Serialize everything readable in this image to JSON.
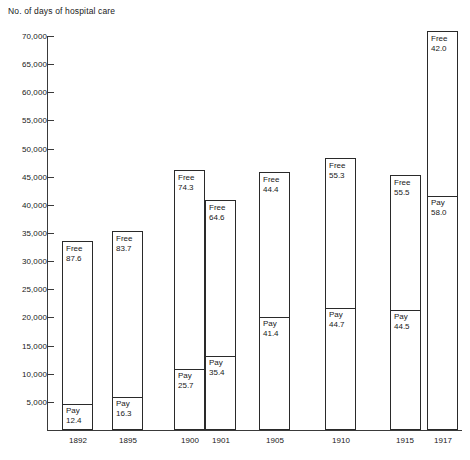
{
  "chart_data": {
    "type": "bar",
    "title": "No. of days of hospital care",
    "xlabel": "",
    "ylabel": "No. of days of hospital care",
    "ylim": [
      0,
      70000
    ],
    "grid": false,
    "legend": "none",
    "stacked": true,
    "note": "Stacked bars: bottom segment = Pay, top segment = Free. Segment labels show percentage share of the bar total.",
    "categories": [
      "1892",
      "1895",
      "1900",
      "1901",
      "1905",
      "1910",
      "1915",
      "1917"
    ],
    "y_ticks": [
      5000,
      10000,
      15000,
      20000,
      25000,
      30000,
      35000,
      40000,
      45000,
      50000,
      55000,
      60000,
      65000,
      70000
    ],
    "y_tick_labels": [
      "5,000",
      "10,000",
      "15,000",
      "20,000",
      "25,000",
      "30,000",
      "35,000",
      "40,000",
      "45,000",
      "50,000",
      "55,000",
      "60,000",
      "65,000",
      "70,000"
    ],
    "series": [
      {
        "name": "Pay",
        "values": [
          4200,
          5800,
          10900,
          13200,
          19500,
          20900,
          20600,
          41000
        ],
        "percent_labels": [
          "12.4",
          "16.3",
          "25.7",
          "35.4",
          "41.4",
          "44.7",
          "44.5",
          "58.0"
        ]
      },
      {
        "name": "Free",
        "values": [
          29700,
          29900,
          31600,
          24100,
          27600,
          25800,
          25700,
          29700
        ],
        "percent_labels": [
          "87.6",
          "83.7",
          "74.3",
          "64.6",
          "58.6",
          "55.3",
          "55.5",
          "42.0"
        ]
      }
    ],
    "bar_totals": [
      33900,
      35700,
      42500,
      37300,
      47100,
      46700,
      46300,
      70700
    ]
  },
  "bars": [
    {
      "year": "1892",
      "x": 62,
      "width": 31,
      "top": 241,
      "bottom": 430,
      "divider": 404,
      "pay": {
        "name": "Pay",
        "value": "12.4"
      },
      "free": {
        "name": "Free",
        "value": "87.6"
      }
    },
    {
      "year": "1895",
      "x": 112,
      "width": 31,
      "top": 231,
      "bottom": 430,
      "divider": 397,
      "pay": {
        "name": "Pay",
        "value": "16.3"
      },
      "free": {
        "name": "Free",
        "value": "83.7"
      }
    },
    {
      "year": "1900",
      "x": 174,
      "width": 31,
      "top": 170,
      "bottom": 430,
      "divider": 369,
      "pay": {
        "name": "Pay",
        "value": "25.7"
      },
      "free": {
        "name": "Free",
        "value": "74.3"
      }
    },
    {
      "year": "1901",
      "x": 205,
      "width": 31,
      "top": 200,
      "bottom": 430,
      "divider": 356,
      "pay": {
        "name": "Pay",
        "value": "35.4"
      },
      "free": {
        "name": "Free",
        "value": "64.6"
      }
    },
    {
      "year": "1905",
      "x": 259,
      "width": 31,
      "top": 172,
      "bottom": 430,
      "divider": 317,
      "pay": {
        "name": "Pay",
        "value": "41.4"
      },
      "free": {
        "name": "Free",
        "value": "44.4"
      }
    },
    {
      "year": "1910",
      "x": 325,
      "width": 31,
      "top": 158,
      "bottom": 430,
      "divider": 308,
      "pay": {
        "name": "Pay",
        "value": "44.7"
      },
      "free": {
        "name": "Free",
        "value": "55.3"
      }
    },
    {
      "year": "1915",
      "x": 390,
      "width": 31,
      "top": 175,
      "bottom": 430,
      "divider": 310,
      "pay": {
        "name": "Pay",
        "value": "44.5"
      },
      "free": {
        "name": "Free",
        "value": "55.5"
      }
    },
    {
      "year": "1917",
      "x": 427,
      "width": 31,
      "top": 31,
      "bottom": 430,
      "divider": 196,
      "pay": {
        "name": "Pay",
        "value": "58.0"
      },
      "free": {
        "name": "Free",
        "value": "42.0"
      }
    }
  ],
  "x_labels": [
    {
      "text": "1892",
      "x": 78
    },
    {
      "text": "1895",
      "x": 128
    },
    {
      "text": "1900",
      "x": 190
    },
    {
      "text": "1901",
      "x": 221
    },
    {
      "text": "1905",
      "x": 275
    },
    {
      "text": "1910",
      "x": 341
    },
    {
      "text": "1915",
      "x": 405
    },
    {
      "text": "1917",
      "x": 443
    }
  ]
}
